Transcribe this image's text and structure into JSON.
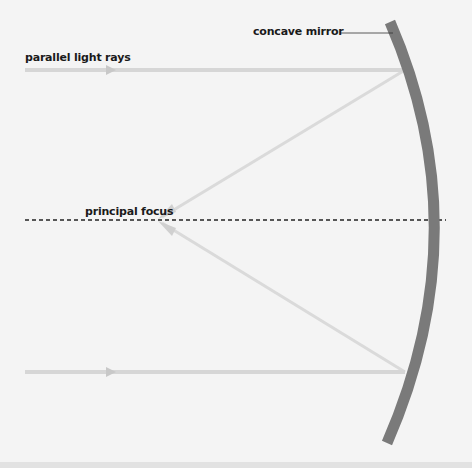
{
  "labels": {
    "mirror": "concave mirror",
    "rays": "parallel light rays",
    "focus": "principal focus"
  },
  "colors": {
    "background": "#f4f4f4",
    "mirror": "#7a7a7a",
    "incident_ray": "#d4d4d4",
    "reflected_ray": "#dadada",
    "arrowhead": "#c8c8c8",
    "axis": "#222222",
    "leader_line": "#333333",
    "bottom_strip": "#e2e2e2"
  },
  "geometry": {
    "focus_point": [
      158,
      220
    ],
    "principal_axis_y": 220,
    "incident_rays_y": [
      70,
      372
    ],
    "ray_start_x": 25,
    "mirror_hit_x": 405
  }
}
